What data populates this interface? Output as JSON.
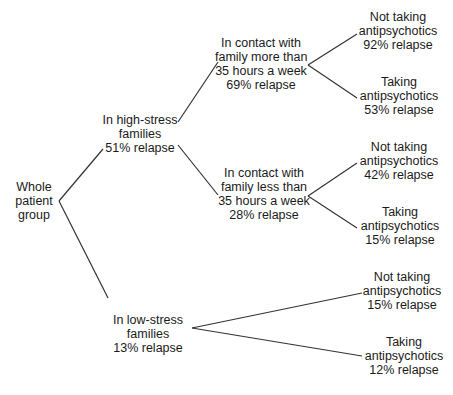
{
  "diagram": {
    "type": "tree",
    "root": {
      "lines": [
        "Whole",
        "patient",
        "group"
      ]
    },
    "level1": [
      {
        "id": "high",
        "lines": [
          "In high-stress",
          "families",
          "51% relapse"
        ]
      },
      {
        "id": "low",
        "lines": [
          "In low-stress",
          "families",
          "13% relapse"
        ]
      }
    ],
    "level2": [
      {
        "id": "more",
        "parent": "high",
        "lines": [
          "In contact with",
          "family more than",
          "35 hours a week",
          "69% relapse"
        ]
      },
      {
        "id": "less",
        "parent": "high",
        "lines": [
          "In contact with",
          "family less than",
          "35 hours a week",
          "28% relapse"
        ]
      }
    ],
    "leaves": [
      {
        "parent": "more",
        "lines": [
          "Not taking",
          "antipsychotics",
          "92% relapse"
        ]
      },
      {
        "parent": "more",
        "lines": [
          "Taking",
          "antipsychotics",
          "53% relapse"
        ]
      },
      {
        "parent": "less",
        "lines": [
          "Not taking",
          "antipsychotics",
          "42% relapse"
        ]
      },
      {
        "parent": "less",
        "lines": [
          "Taking",
          "antipsychotics",
          "15% relapse"
        ]
      },
      {
        "parent": "low",
        "lines": [
          "Not taking",
          "antipsychotics",
          "15% relapse"
        ]
      },
      {
        "parent": "low",
        "lines": [
          "Taking",
          "antipsychotics",
          "12% relapse"
        ]
      }
    ],
    "line_color": "#333333"
  }
}
